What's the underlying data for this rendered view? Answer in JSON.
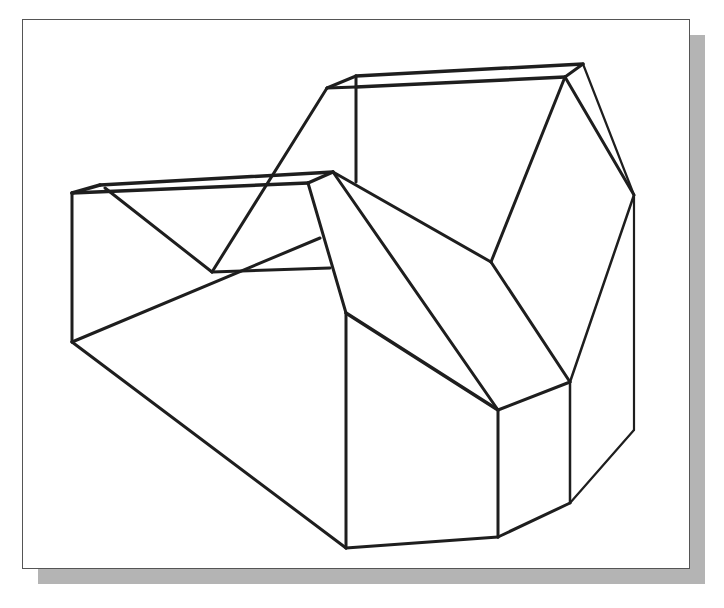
{
  "figure": {
    "type": "isometric-wireframe",
    "colors": {
      "background": "#ffffff",
      "line": "#1e1e1e",
      "frame_border": "#555555",
      "shadow": "#b4b4b4"
    },
    "frame": {
      "x": 22,
      "y": 19,
      "width": 668,
      "height": 550
    },
    "shadow_offset": 15,
    "edges": [
      {
        "x1": 72,
        "y1": 193,
        "x2": 308,
        "y2": 183,
        "w": 3.5
      },
      {
        "x1": 100,
        "y1": 185,
        "x2": 333,
        "y2": 172,
        "w": 3.5
      },
      {
        "x1": 72,
        "y1": 193,
        "x2": 100,
        "y2": 185,
        "w": 3.5
      },
      {
        "x1": 308,
        "y1": 183,
        "x2": 333,
        "y2": 172,
        "w": 3.5
      },
      {
        "x1": 72,
        "y1": 193,
        "x2": 72,
        "y2": 342,
        "w": 3
      },
      {
        "x1": 72,
        "y1": 342,
        "x2": 346,
        "y2": 548,
        "w": 3
      },
      {
        "x1": 72,
        "y1": 342,
        "x2": 320,
        "y2": 238,
        "w": 3
      },
      {
        "x1": 105,
        "y1": 188,
        "x2": 212,
        "y2": 272,
        "w": 3
      },
      {
        "x1": 212,
        "y1": 272,
        "x2": 327,
        "y2": 88,
        "w": 3
      },
      {
        "x1": 212,
        "y1": 272,
        "x2": 330,
        "y2": 268,
        "w": 3
      },
      {
        "x1": 327,
        "y1": 88,
        "x2": 356,
        "y2": 76,
        "w": 3
      },
      {
        "x1": 327,
        "y1": 88,
        "x2": 356,
        "y2": 87,
        "w": 3
      },
      {
        "x1": 356,
        "y1": 76,
        "x2": 583,
        "y2": 64,
        "w": 3.5
      },
      {
        "x1": 356,
        "y1": 87,
        "x2": 565,
        "y2": 77,
        "w": 3.5
      },
      {
        "x1": 565,
        "y1": 77,
        "x2": 583,
        "y2": 64,
        "w": 3
      },
      {
        "x1": 356,
        "y1": 76,
        "x2": 356,
        "y2": 182,
        "w": 3
      },
      {
        "x1": 583,
        "y1": 64,
        "x2": 634,
        "y2": 195,
        "w": 2.2
      },
      {
        "x1": 565,
        "y1": 77,
        "x2": 634,
        "y2": 195,
        "w": 3
      },
      {
        "x1": 565,
        "y1": 77,
        "x2": 491,
        "y2": 262,
        "w": 3
      },
      {
        "x1": 634,
        "y1": 195,
        "x2": 634,
        "y2": 430,
        "w": 2.2
      },
      {
        "x1": 634,
        "y1": 430,
        "x2": 570,
        "y2": 503,
        "w": 2.2
      },
      {
        "x1": 634,
        "y1": 195,
        "x2": 570,
        "y2": 382,
        "w": 2.5
      },
      {
        "x1": 491,
        "y1": 262,
        "x2": 570,
        "y2": 382,
        "w": 3
      },
      {
        "x1": 491,
        "y1": 262,
        "x2": 333,
        "y2": 172,
        "w": 3
      },
      {
        "x1": 333,
        "y1": 172,
        "x2": 498,
        "y2": 410,
        "w": 3
      },
      {
        "x1": 308,
        "y1": 183,
        "x2": 346,
        "y2": 313,
        "w": 3
      },
      {
        "x1": 346,
        "y1": 313,
        "x2": 498,
        "y2": 410,
        "w": 3.5
      },
      {
        "x1": 498,
        "y1": 410,
        "x2": 570,
        "y2": 382,
        "w": 3
      },
      {
        "x1": 346,
        "y1": 313,
        "x2": 346,
        "y2": 548,
        "w": 3
      },
      {
        "x1": 498,
        "y1": 410,
        "x2": 498,
        "y2": 537,
        "w": 3
      },
      {
        "x1": 570,
        "y1": 382,
        "x2": 570,
        "y2": 503,
        "w": 2.5
      },
      {
        "x1": 346,
        "y1": 548,
        "x2": 498,
        "y2": 537,
        "w": 3
      },
      {
        "x1": 498,
        "y1": 537,
        "x2": 570,
        "y2": 503,
        "w": 3
      }
    ]
  }
}
